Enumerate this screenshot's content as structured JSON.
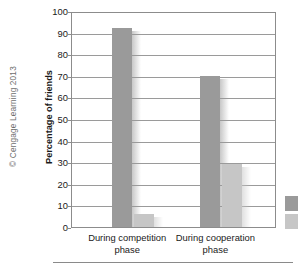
{
  "figure": {
    "credit": "© Cengage Learning 2013",
    "bottom_rule": true
  },
  "colors": {
    "series_dark": "#9a9a9a",
    "series_light": "#c6c6c6",
    "axis": "#8c8c8c",
    "grid": "#9a9a9a",
    "text": "#1a1a1a",
    "credit_text": "#6e6e6e",
    "background": "#ffffff"
  },
  "chart_data": {
    "type": "bar",
    "title": "",
    "xlabel": "",
    "ylabel": "Percentage of friends",
    "categories": [
      "During competition phase",
      "During cooperation phase"
    ],
    "category_lines": [
      [
        "During competition",
        "phase"
      ],
      [
        "During cooperation",
        "phase"
      ]
    ],
    "series": [
      {
        "name": "series-1",
        "color": "#9a9a9a",
        "values": [
          92,
          70
        ]
      },
      {
        "name": "series-2",
        "color": "#c6c6c6",
        "values": [
          6,
          29
        ]
      }
    ],
    "ylim": [
      0,
      100
    ],
    "ytick_labels": [
      "100",
      "90",
      "80",
      "70",
      "60",
      "50",
      "40",
      "30",
      "20",
      "10",
      "0"
    ],
    "ytick_values": [
      100,
      90,
      80,
      70,
      60,
      50,
      40,
      30,
      20,
      10,
      0
    ],
    "ytick_step": 10,
    "grid": "horizontal",
    "legend_position": "right-outside",
    "legend_labels": [
      "",
      ""
    ]
  }
}
